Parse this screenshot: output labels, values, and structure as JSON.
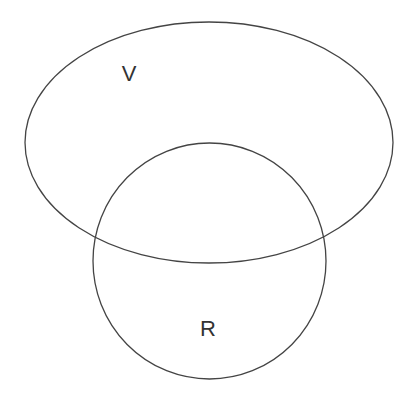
{
  "diagram": {
    "type": "venn",
    "stroke_color": "#444444",
    "background": "#ffffff",
    "sets": [
      {
        "id": "V",
        "label": "V",
        "shape": "ellipse",
        "cx": 209,
        "cy": 142.5,
        "rx": 184,
        "ry": 120.5,
        "label_x": 129,
        "label_y": 81
      },
      {
        "id": "R",
        "label": "R",
        "shape": "circle",
        "cx": 209.5,
        "cy": 261,
        "rx": 116.5,
        "ry": 118,
        "label_x": 208,
        "label_y": 336
      }
    ]
  }
}
